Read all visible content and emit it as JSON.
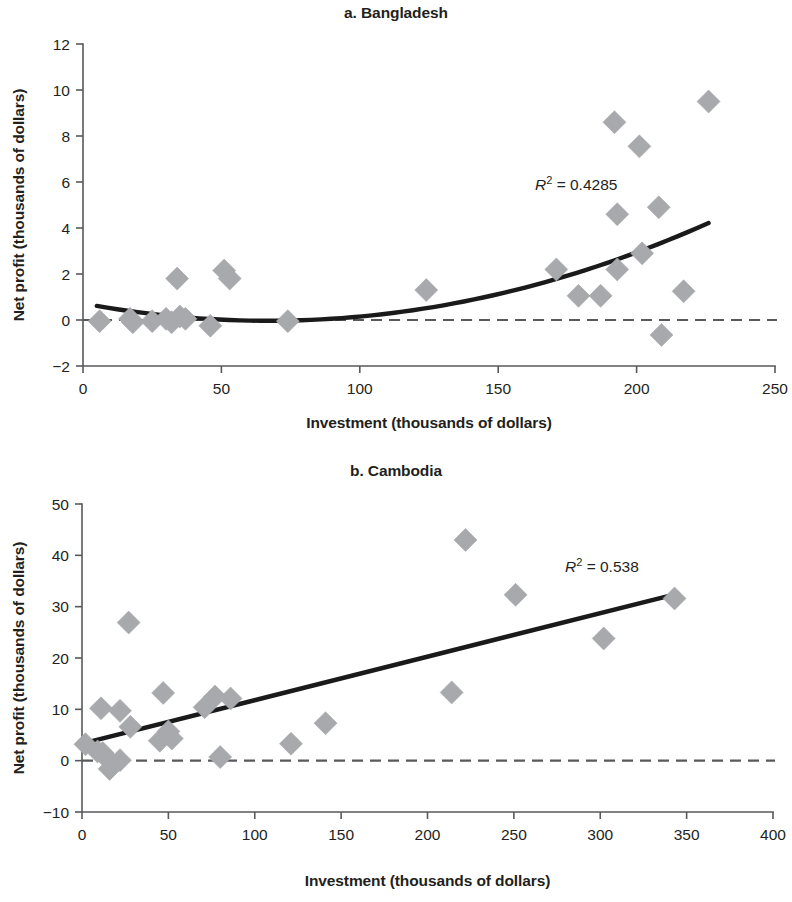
{
  "figure": {
    "panels": [
      {
        "id": "a",
        "title": "a. Bangladesh",
        "r2_prefix": "R",
        "r2_exponent": "2",
        "r2_equals": " = ",
        "r2_value": "0.4285"
      },
      {
        "id": "b",
        "title": "b. Cambodia",
        "r2_prefix": "R",
        "r2_exponent": "2",
        "r2_equals": " = ",
        "r2_value": "0.538"
      }
    ]
  },
  "chart_data": [
    {
      "type": "scatter",
      "title": "a. Bangladesh",
      "xlabel": "Investment (thousands of dollars)",
      "ylabel": "Net profit (thousands of dollars)",
      "xlim": [
        0,
        250
      ],
      "ylim": [
        -2,
        12
      ],
      "xticks": [
        0,
        50,
        100,
        150,
        200,
        250
      ],
      "yticks": [
        -2,
        0,
        2,
        4,
        6,
        8,
        10,
        12
      ],
      "xtick_labels": [
        "0",
        "50",
        "100",
        "150",
        "200",
        "250"
      ],
      "ytick_labels": [
        "−2",
        "0",
        "2",
        "4",
        "6",
        "8",
        "10",
        "12"
      ],
      "grid": false,
      "legend": "none",
      "annotations": [
        {
          "text": "R2 = 0.4285",
          "x": 196,
          "y": 6.1
        }
      ],
      "reference_lines": [
        {
          "orientation": "horizontal",
          "y": 0,
          "style": "dashed"
        }
      ],
      "points": [
        {
          "x": 6,
          "y": -0.05
        },
        {
          "x": 17,
          "y": 0.05
        },
        {
          "x": 18,
          "y": -0.1
        },
        {
          "x": 25,
          "y": -0.05
        },
        {
          "x": 30,
          "y": 0.05
        },
        {
          "x": 32,
          "y": -0.1
        },
        {
          "x": 34,
          "y": 1.8
        },
        {
          "x": 35,
          "y": 0.15
        },
        {
          "x": 37,
          "y": 0.05
        },
        {
          "x": 46,
          "y": -0.25
        },
        {
          "x": 51,
          "y": 2.15
        },
        {
          "x": 53,
          "y": 1.8
        },
        {
          "x": 74,
          "y": -0.05
        },
        {
          "x": 124,
          "y": 1.3
        },
        {
          "x": 171,
          "y": 2.2
        },
        {
          "x": 179,
          "y": 1.05
        },
        {
          "x": 187,
          "y": 1.05
        },
        {
          "x": 192,
          "y": 8.6
        },
        {
          "x": 193,
          "y": 4.6
        },
        {
          "x": 193,
          "y": 2.2
        },
        {
          "x": 201,
          "y": 7.55
        },
        {
          "x": 202,
          "y": 2.9
        },
        {
          "x": 208,
          "y": 4.9
        },
        {
          "x": 209,
          "y": -0.65
        },
        {
          "x": 217,
          "y": 1.25
        },
        {
          "x": 226,
          "y": 9.5
        }
      ],
      "trend": {
        "kind": "quadratic",
        "description": "upward-curving polynomial fit",
        "x_start": 5,
        "x_end": 226,
        "coefficients": {
          "a": 0.000168,
          "b": -0.0225,
          "c": 0.72
        }
      }
    },
    {
      "type": "scatter",
      "title": "b. Cambodia",
      "xlabel": "Investment (thousands of dollars)",
      "ylabel": "Net profit (thousands of dollars)",
      "xlim": [
        0,
        400
      ],
      "ylim": [
        -10,
        50
      ],
      "xticks": [
        0,
        50,
        100,
        150,
        200,
        250,
        300,
        350,
        400
      ],
      "yticks": [
        -10,
        0,
        10,
        20,
        30,
        40,
        50
      ],
      "xtick_labels": [
        "0",
        "50",
        "100",
        "150",
        "200",
        "250",
        "300",
        "350",
        "400"
      ],
      "ytick_labels": [
        "−10",
        "0",
        "10",
        "20",
        "30",
        "40",
        "50"
      ],
      "grid": false,
      "legend": "none",
      "annotations": [
        {
          "text": "R2 = 0.538",
          "x": 288,
          "y": 37.5
        }
      ],
      "reference_lines": [
        {
          "orientation": "horizontal",
          "y": 0,
          "style": "dashed"
        }
      ],
      "points": [
        {
          "x": 2,
          "y": 3.2
        },
        {
          "x": 9,
          "y": 1.8
        },
        {
          "x": 11,
          "y": 10.2
        },
        {
          "x": 12,
          "y": 1.5
        },
        {
          "x": 14,
          "y": 0.6
        },
        {
          "x": 16,
          "y": -1.6
        },
        {
          "x": 22,
          "y": 9.7
        },
        {
          "x": 22,
          "y": 0.1
        },
        {
          "x": 27,
          "y": 26.9
        },
        {
          "x": 28,
          "y": 6.6
        },
        {
          "x": 45,
          "y": 3.9
        },
        {
          "x": 47,
          "y": 13.2
        },
        {
          "x": 50,
          "y": 5.7
        },
        {
          "x": 52,
          "y": 4.3
        },
        {
          "x": 71,
          "y": 10.4
        },
        {
          "x": 77,
          "y": 12.5
        },
        {
          "x": 80,
          "y": 0.7
        },
        {
          "x": 86,
          "y": 12.1
        },
        {
          "x": 121,
          "y": 3.3
        },
        {
          "x": 141,
          "y": 7.3
        },
        {
          "x": 214,
          "y": 13.3
        },
        {
          "x": 222,
          "y": 43.0
        },
        {
          "x": 251,
          "y": 32.3
        },
        {
          "x": 302,
          "y": 23.8
        },
        {
          "x": 343,
          "y": 31.6
        }
      ],
      "trend": {
        "kind": "linear",
        "description": "positive linear regression line",
        "x_start": 0,
        "x_end": 341,
        "intercept": 3.3,
        "slope": 0.0848
      }
    }
  ]
}
